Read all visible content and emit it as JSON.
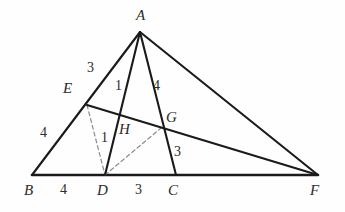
{
  "figure": {
    "kind": "geometry-diagram",
    "width": 345,
    "height": 212,
    "background_color": "#fefefe",
    "stroke_color": "#1a1a1a",
    "dashed_color": "#8d8d8d"
  },
  "points": [
    {
      "id": "A",
      "label": "A",
      "x": 140,
      "y": 32,
      "label_x": 136,
      "label_y": 8
    },
    {
      "id": "B",
      "label": "B",
      "x": 32,
      "y": 175,
      "label_x": 24,
      "label_y": 183
    },
    {
      "id": "C",
      "label": "C",
      "x": 176,
      "y": 175,
      "label_x": 168,
      "label_y": 183
    },
    {
      "id": "D",
      "label": "D",
      "x": 105,
      "y": 175,
      "label_x": 97,
      "label_y": 183
    },
    {
      "id": "E",
      "label": "E",
      "x": 87,
      "y": 105,
      "label_x": 63,
      "label_y": 81
    },
    {
      "id": "F",
      "label": "F",
      "x": 318,
      "y": 175,
      "label_x": 310,
      "label_y": 183
    },
    {
      "id": "G",
      "label": "G",
      "x": 161,
      "y": 128,
      "label_x": 166,
      "label_y": 110
    },
    {
      "id": "H",
      "label": "H",
      "x": 120,
      "y": 128,
      "label_x": 119,
      "label_y": 122
    }
  ],
  "solid_segments": [
    {
      "name": "segment-AB",
      "from": "A",
      "to": "B"
    },
    {
      "name": "segment-AD",
      "from": "A",
      "to": "D"
    },
    {
      "name": "segment-AC",
      "from": "A",
      "to": "C"
    },
    {
      "name": "segment-AF",
      "from": "A",
      "to": "F"
    },
    {
      "name": "segment-EF",
      "from": "E",
      "to": "F"
    }
  ],
  "base_segments": [
    {
      "name": "segment-BF",
      "from": "B",
      "to": "F"
    }
  ],
  "dashed_segments": [
    {
      "name": "segment-ED",
      "from": "E",
      "to": "D"
    },
    {
      "name": "segment-DG",
      "from": "D",
      "to": "G"
    }
  ],
  "length_labels": [
    {
      "name": "length-AE",
      "text": "3",
      "x": 87,
      "y": 61,
      "on": "AE"
    },
    {
      "name": "length-AH",
      "text": "1",
      "x": 115,
      "y": 79,
      "on": "AH"
    },
    {
      "name": "length-AG",
      "text": "4",
      "x": 153,
      "y": 79,
      "on": "AG"
    },
    {
      "name": "length-EB",
      "text": "4",
      "x": 40,
      "y": 126,
      "on": "EB"
    },
    {
      "name": "length-HD",
      "text": "1",
      "x": 101,
      "y": 131,
      "on": "HD"
    },
    {
      "name": "length-GC",
      "text": "3",
      "x": 174,
      "y": 145,
      "on": "GC"
    },
    {
      "name": "length-BD",
      "text": "4",
      "x": 60,
      "y": 183,
      "on": "BD"
    },
    {
      "name": "length-DC",
      "text": "3",
      "x": 135,
      "y": 183,
      "on": "DC"
    }
  ]
}
